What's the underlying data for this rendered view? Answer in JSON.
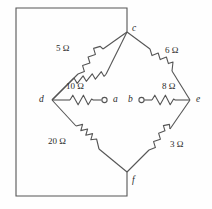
{
  "figure": {
    "kind": "circuit-diagram",
    "line_color": "#555555",
    "text_color": "#2b2b2b",
    "background": "#fefefe"
  },
  "nodes": [
    {
      "id": "c",
      "label": "c",
      "x": 127,
      "y": 32,
      "label_x": 132,
      "label_y": 24,
      "terminal": false
    },
    {
      "id": "d",
      "label": "d",
      "x": 52,
      "y": 100,
      "label_x": 39,
      "label_y": 95,
      "terminal": false
    },
    {
      "id": "e",
      "label": "e",
      "x": 190,
      "y": 100,
      "label_x": 196,
      "label_y": 95,
      "terminal": false
    },
    {
      "id": "f",
      "label": "f",
      "x": 127,
      "y": 172,
      "label_x": 132,
      "label_y": 176,
      "terminal": false
    },
    {
      "id": "a",
      "label": "a",
      "x": 107,
      "y": 100,
      "label_x": 113,
      "label_y": 95,
      "terminal": true
    },
    {
      "id": "b",
      "label": "b",
      "x": 137,
      "y": 100,
      "label_x": 128,
      "label_y": 95,
      "terminal": true
    }
  ],
  "resistors": [
    {
      "id": "r-5",
      "value": "5 Ω",
      "between": "d-c",
      "label_x": 60,
      "label_y": 50
    },
    {
      "id": "r-6",
      "value": "6 Ω",
      "between": "c-e",
      "label_x": 163,
      "label_y": 50
    },
    {
      "id": "r-20",
      "value": "20 Ω",
      "between": "d-f",
      "label_x": 54,
      "label_y": 142
    },
    {
      "id": "r-3",
      "value": "3 Ω",
      "between": "f-e",
      "label_x": 166,
      "label_y": 142
    },
    {
      "id": "r-10",
      "value": "10 Ω",
      "between": "d-a",
      "label_x": 64,
      "label_y": 85
    },
    {
      "id": "r-8",
      "value": "8 Ω",
      "between": "b-e",
      "label_x": 163,
      "label_y": 85
    }
  ],
  "outer_rectangle": {
    "left": 16,
    "top": 8,
    "right": 128,
    "bottom": 196
  }
}
